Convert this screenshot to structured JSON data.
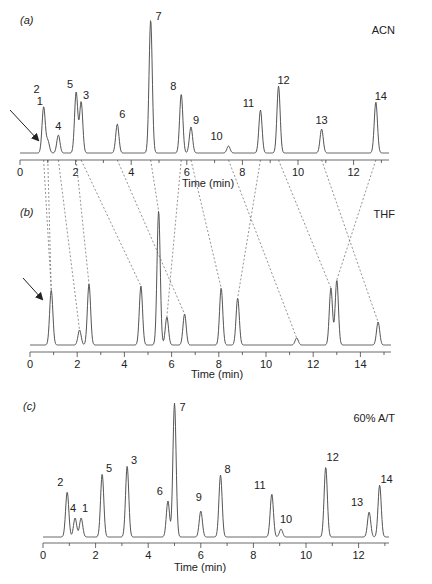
{
  "figure": {
    "colors": {
      "trace": "#555555",
      "axis": "#444444",
      "text": "#222222",
      "dash": "#666666"
    }
  },
  "chart_data": [
    {
      "type": "line",
      "panel_label": "(a)",
      "title": "ACN",
      "xlabel": "Time (min)",
      "ylabel": "",
      "xlim": [
        0,
        13.2
      ],
      "xticks": [
        0,
        2,
        4,
        6,
        8,
        10,
        12
      ],
      "grid": false,
      "annotation": "arrow pointing to peak 2/1 region",
      "peaks": [
        {
          "label": "2",
          "rt": 0.85,
          "height": 46
        },
        {
          "label": "1",
          "rt": 1.0,
          "height": 12
        },
        {
          "label": "4",
          "rt": 1.38,
          "height": 18
        },
        {
          "label": "5",
          "rt": 2.02,
          "height": 61
        },
        {
          "label": "3",
          "rt": 2.2,
          "height": 51
        },
        {
          "label": "6",
          "rt": 3.5,
          "height": 29
        },
        {
          "label": "7",
          "rt": 4.7,
          "height": 133
        },
        {
          "label": "8",
          "rt": 5.8,
          "height": 59
        },
        {
          "label": "9",
          "rt": 6.15,
          "height": 26
        },
        {
          "label": "10",
          "rt": 7.5,
          "height": 7
        },
        {
          "label": "11",
          "rt": 8.65,
          "height": 43
        },
        {
          "label": "12",
          "rt": 9.3,
          "height": 67
        },
        {
          "label": "13",
          "rt": 10.85,
          "height": 24
        },
        {
          "label": "14",
          "rt": 12.8,
          "height": 51
        }
      ]
    },
    {
      "type": "line",
      "panel_label": "(b)",
      "title": "THF",
      "xlabel": "Time (min)",
      "ylabel": "",
      "xlim": [
        0,
        15.2
      ],
      "xticks": [
        0,
        2,
        4,
        6,
        8,
        10,
        12,
        14
      ],
      "grid": false,
      "annotation": "arrow pointing to first peak",
      "peaks": [
        {
          "label": "1+2",
          "rt": 0.9,
          "height": 55
        },
        {
          "label": "4",
          "rt": 2.1,
          "height": 15
        },
        {
          "label": "5",
          "rt": 2.5,
          "height": 61
        },
        {
          "label": "3",
          "rt": 4.7,
          "height": 59
        },
        {
          "label": "7",
          "rt": 5.45,
          "height": 134
        },
        {
          "label": "8",
          "rt": 5.8,
          "height": 28
        },
        {
          "label": "6",
          "rt": 6.55,
          "height": 31
        },
        {
          "label": "9",
          "rt": 8.1,
          "height": 57
        },
        {
          "label": "11",
          "rt": 8.8,
          "height": 47
        },
        {
          "label": "10",
          "rt": 11.3,
          "height": 7
        },
        {
          "label": "12",
          "rt": 12.75,
          "height": 57
        },
        {
          "label": "14",
          "rt": 13.0,
          "height": 65
        },
        {
          "label": "13",
          "rt": 14.75,
          "height": 23
        }
      ]
    },
    {
      "type": "line",
      "panel_label": "(c)",
      "title": "60% A/T",
      "xlabel": "Time (min)",
      "ylabel": "",
      "xlim": [
        0,
        13.2
      ],
      "xticks": [
        0,
        2,
        4,
        6,
        8,
        10,
        12
      ],
      "grid": false,
      "peaks": [
        {
          "label": "2",
          "rt": 0.92,
          "height": 45
        },
        {
          "label": "4",
          "rt": 1.22,
          "height": 19
        },
        {
          "label": "1",
          "rt": 1.45,
          "height": 19
        },
        {
          "label": "5",
          "rt": 2.25,
          "height": 63
        },
        {
          "label": "3",
          "rt": 3.2,
          "height": 71
        },
        {
          "label": "6",
          "rt": 4.75,
          "height": 36
        },
        {
          "label": "7",
          "rt": 5.0,
          "height": 134
        },
        {
          "label": "9",
          "rt": 6.0,
          "height": 26
        },
        {
          "label": "8",
          "rt": 6.75,
          "height": 62
        },
        {
          "label": "11",
          "rt": 8.7,
          "height": 43
        },
        {
          "label": "10",
          "rt": 9.05,
          "height": 8
        },
        {
          "label": "12",
          "rt": 10.75,
          "height": 70
        },
        {
          "label": "13",
          "rt": 12.4,
          "height": 25
        },
        {
          "label": "14",
          "rt": 12.8,
          "height": 52
        }
      ]
    }
  ],
  "connections_a_to_b": [
    {
      "peak": "2",
      "a_rt": 0.85,
      "b_rt": 0.9
    },
    {
      "peak": "1",
      "a_rt": 1.0,
      "b_rt": 0.9
    },
    {
      "peak": "4",
      "a_rt": 1.38,
      "b_rt": 2.1
    },
    {
      "peak": "5",
      "a_rt": 2.02,
      "b_rt": 2.5
    },
    {
      "peak": "3",
      "a_rt": 2.2,
      "b_rt": 4.7
    },
    {
      "peak": "6",
      "a_rt": 3.5,
      "b_rt": 6.55
    },
    {
      "peak": "7",
      "a_rt": 4.7,
      "b_rt": 5.45
    },
    {
      "peak": "8",
      "a_rt": 5.8,
      "b_rt": 5.8
    },
    {
      "peak": "9",
      "a_rt": 6.15,
      "b_rt": 8.1
    },
    {
      "peak": "10",
      "a_rt": 7.5,
      "b_rt": 11.3
    },
    {
      "peak": "11",
      "a_rt": 8.65,
      "b_rt": 8.8
    },
    {
      "peak": "12",
      "a_rt": 9.3,
      "b_rt": 12.75
    },
    {
      "peak": "13",
      "a_rt": 10.85,
      "b_rt": 14.75
    },
    {
      "peak": "14",
      "a_rt": 12.8,
      "b_rt": 13.0
    }
  ]
}
